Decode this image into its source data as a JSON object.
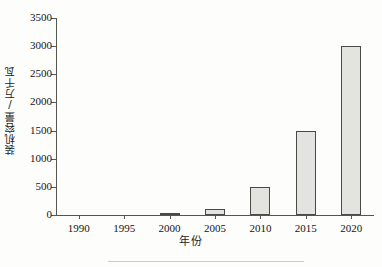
{
  "chart_data": {
    "type": "bar",
    "title": "",
    "xlabel": "年份",
    "ylabel": "装机容量/万千瓦",
    "categories": [
      "1990",
      "1995",
      "2000",
      "2005",
      "2010",
      "2015",
      "2020"
    ],
    "values": [
      0,
      0,
      30,
      100,
      500,
      1500,
      3000
    ],
    "series": [
      {
        "name": "装机容量",
        "values": [
          0,
          0,
          30,
          100,
          500,
          1500,
          3000
        ]
      }
    ],
    "ylim": [
      0,
      3500
    ],
    "ytick_step": 500,
    "yticks": [
      "0",
      "500",
      "1000",
      "1500",
      "2000",
      "2500",
      "3000",
      "3500"
    ],
    "xticks": [
      "1990",
      "1995",
      "2000",
      "2005",
      "2010",
      "2015",
      "2020"
    ],
    "grid": false,
    "legend": null,
    "legend_position": "none",
    "annotations": [],
    "bar_fill_color": "#e3e3df",
    "bar_border_color": "#4a4a47",
    "axis_color": "#555552"
  }
}
